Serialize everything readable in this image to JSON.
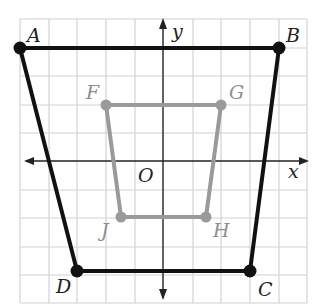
{
  "diagram": {
    "type": "coordinate-plane",
    "grid": {
      "x_min": -5,
      "x_max": 5,
      "y_min": -5,
      "y_max": 5,
      "step": 1,
      "color": "#cfcfcf"
    },
    "axes": {
      "x_label": "x",
      "y_label": "y",
      "origin_label": "O",
      "color": "#222222"
    },
    "outer_quadrilateral": {
      "name": "ABCD",
      "color": "#111111",
      "vertices": [
        {
          "label": "A",
          "x": -5,
          "y": 4
        },
        {
          "label": "B",
          "x": 4,
          "y": 4
        },
        {
          "label": "C",
          "x": 3,
          "y": -4
        },
        {
          "label": "D",
          "x": -3,
          "y": -4
        }
      ]
    },
    "inner_quadrilateral": {
      "name": "FGHJ",
      "color": "#999999",
      "vertices": [
        {
          "label": "F",
          "x": -2,
          "y": 2
        },
        {
          "label": "G",
          "x": 2,
          "y": 2
        },
        {
          "label": "H",
          "x": 1.5,
          "y": -2
        },
        {
          "label": "J",
          "x": -1.5,
          "y": -2
        }
      ]
    }
  }
}
